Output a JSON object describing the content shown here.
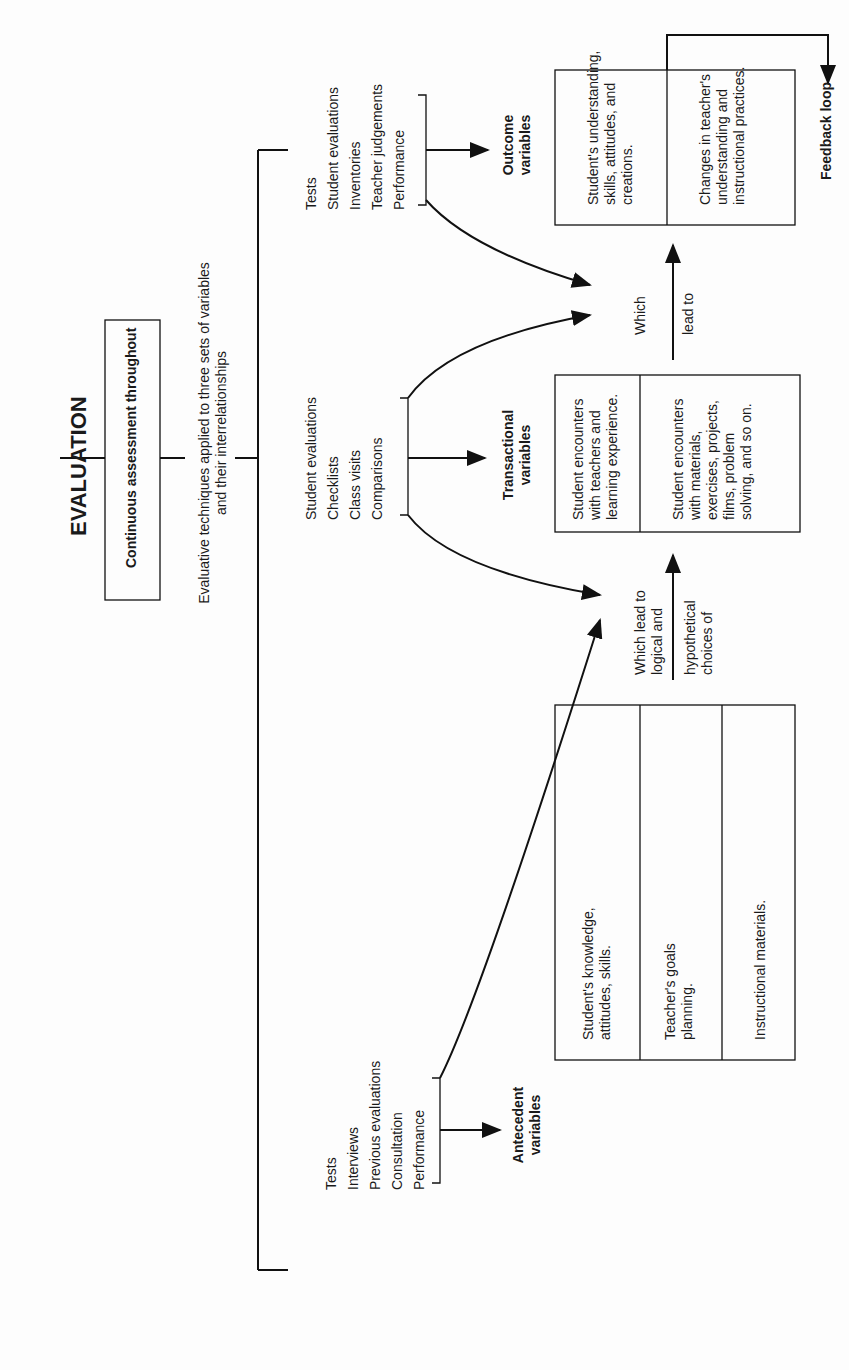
{
  "title": "EVALUATION",
  "continuous_box": "Continuous assessment throughout",
  "techniques_text": [
    "Evaluative techniques applied to three sets of variables",
    "and their interrelationships"
  ],
  "technique_groups": {
    "antecedent": [
      "Tests",
      "Interviews",
      "Previous evaluations",
      "Consultation",
      "Performance"
    ],
    "transactional": [
      "Student evaluations",
      "Checklists",
      "Class visits",
      "Comparisons"
    ],
    "outcome": [
      "Tests",
      "Student evaluations",
      "Inventories",
      "Teacher judgements",
      "Performance"
    ]
  },
  "variables": {
    "antecedent": {
      "heading": [
        "Antecedent",
        "variables"
      ],
      "cells": [
        [
          "Student's knowledge,",
          "attitudes, skills."
        ],
        [
          "Teacher's goals",
          "planning."
        ],
        [
          "Instructional materials."
        ]
      ]
    },
    "transactional": {
      "heading": [
        "Transactional",
        "variables"
      ],
      "cells": [
        [
          "Student encounters",
          "with teachers and",
          "learning experience."
        ],
        [
          "Student encounters",
          "with materials,",
          "exercises, projects,",
          "films, problem",
          "solving, and so on."
        ]
      ]
    },
    "outcome": {
      "heading": [
        "Outcome",
        "variables"
      ],
      "cells": [
        [
          "Student's understanding,",
          "skills, attitudes, and",
          "creations."
        ],
        [
          "Changes in teacher's",
          "understanding and",
          "instructional practices."
        ]
      ]
    }
  },
  "connectors": {
    "lead1": [
      "Which lead to",
      "logical and",
      "hypothetical",
      "choices of"
    ],
    "lead2": [
      "Which",
      "lead to"
    ]
  },
  "feedback_label": "Feedback loop"
}
